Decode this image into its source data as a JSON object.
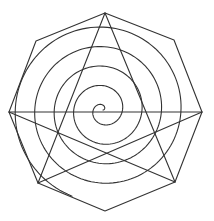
{
  "figure": {
    "width": 214,
    "height": 221,
    "stroke_color": "#333333",
    "background": "#ffffff",
    "octagon": {
      "points": [
        [
          105,
          13
        ],
        [
          174,
          40
        ],
        [
          202,
          112
        ],
        [
          175,
          182
        ],
        [
          105,
          211
        ],
        [
          38,
          183
        ],
        [
          9,
          112
        ],
        [
          36,
          41
        ]
      ]
    },
    "star_lines": [
      {
        "from": [
          105,
          13
        ],
        "to": [
          38,
          183
        ]
      },
      {
        "from": [
          105,
          13
        ],
        "to": [
          175,
          182
        ]
      },
      {
        "from": [
          9,
          112
        ],
        "to": [
          202,
          112
        ]
      },
      {
        "from": [
          9,
          112
        ],
        "to": [
          175,
          182
        ]
      },
      {
        "from": [
          202,
          112
        ],
        "to": [
          38,
          183
        ]
      }
    ],
    "spiral": {
      "center": [
        103,
        110
      ],
      "start_radius": 0,
      "growth_per_turn": 19.5,
      "turns": 4.7,
      "start_angle_deg": 0
    }
  }
}
